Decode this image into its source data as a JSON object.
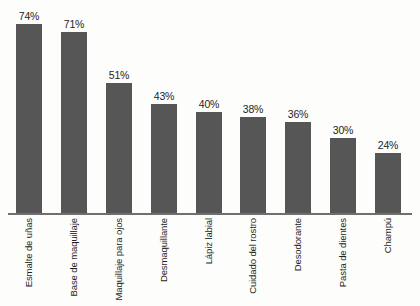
{
  "chart_data": {
    "type": "bar",
    "title": "",
    "subtitle": "",
    "xlabel": "",
    "ylabel": "",
    "ylim": [
      0,
      80
    ],
    "grid": false,
    "legend": "none",
    "orientation": "vertical",
    "bar_color": "#565656",
    "background_color": "#fdfdfc",
    "axis_color": "#6f6f6f",
    "value_label_suffix": "%",
    "categories": [
      "Esmalte de uñas",
      "Base de maquillaje",
      "Maquillaje para ojos",
      "Desmaquillante",
      "Lápiz labial",
      "Cuidado del rostro",
      "Desodorante",
      "Pasta de dientes",
      "Champú"
    ],
    "values": [
      74,
      71,
      51,
      43,
      40,
      38,
      36,
      30,
      24
    ],
    "value_labels": [
      "74%",
      "71%",
      "51%",
      "43%",
      "40%",
      "38%",
      "36%",
      "30%",
      "24%"
    ]
  }
}
